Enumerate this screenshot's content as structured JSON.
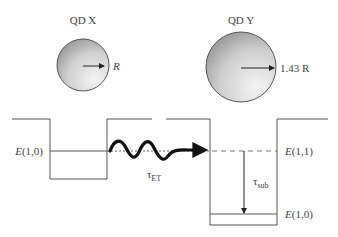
{
  "qd_x": {
    "title": "QD X",
    "radius_label": "R"
  },
  "qd_y": {
    "title": "QD Y",
    "radius_label": "1.43 R"
  },
  "levels": {
    "left_e10": "E(1,0)",
    "right_e11": "E(1,1)",
    "right_e10": "E(1,0)"
  },
  "transitions": {
    "energy_transfer": {
      "symbol": "τ",
      "sub": "ET"
    },
    "sublevel_relaxation": {
      "symbol": "τ",
      "sub": "sub"
    }
  },
  "colors": {
    "line": "#555555",
    "arrow": "#111111",
    "sphere_dark": "#8a8a8a",
    "sphere_light": "#f2f2f2"
  }
}
